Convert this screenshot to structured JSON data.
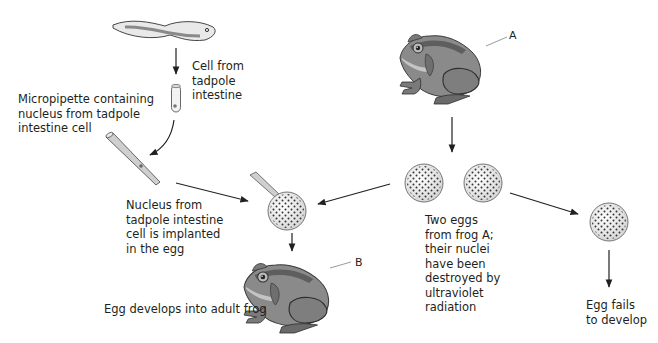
{
  "diagram": {
    "type": "process-flow",
    "topic": "Nuclear transplantation in frogs",
    "labels": {
      "cell_from_tadpole": "Cell from\ntadpole\nintestine",
      "micropipette": "Micropipette containing\nnucleus from tadpole\nintestine cell",
      "nucleus_implanted": "Nucleus from\ntadpole intestine\ncell is implanted\nin the egg",
      "egg_develops": "Egg develops into adult frog",
      "two_eggs": "Two eggs\nfrom frog A;\ntheir nuclei\nhave been\ndestroyed by\nultraviolet\nradiation",
      "egg_fails": "Egg fails\nto develop",
      "frog_a": "A",
      "frog_b": "B"
    },
    "nodes": [
      {
        "id": "tadpole",
        "name": "Tadpole"
      },
      {
        "id": "intestine-cell",
        "name": "Cell from tadpole intestine"
      },
      {
        "id": "micropipette",
        "name": "Micropipette with nucleus"
      },
      {
        "id": "frog-a",
        "name": "Frog A"
      },
      {
        "id": "egg-1",
        "name": "Enucleated egg 1"
      },
      {
        "id": "egg-2",
        "name": "Enucleated egg 2"
      },
      {
        "id": "implanted-egg",
        "name": "Egg with implanted nucleus"
      },
      {
        "id": "frog-b",
        "name": "Frog B (adult)"
      },
      {
        "id": "failed-egg",
        "name": "Egg fails to develop"
      }
    ],
    "edges": [
      {
        "from": "tadpole",
        "to": "intestine-cell"
      },
      {
        "from": "intestine-cell",
        "to": "micropipette"
      },
      {
        "from": "micropipette",
        "to": "implanted-egg"
      },
      {
        "from": "frog-a",
        "to": "egg-1"
      },
      {
        "from": "egg-1",
        "to": "implanted-egg"
      },
      {
        "from": "egg-2",
        "to": "failed-egg"
      },
      {
        "from": "implanted-egg",
        "to": "frog-b"
      }
    ],
    "colors": {
      "frog_body": "#8a8a8a",
      "frog_dark": "#5e5e5e",
      "frog_light": "#c4c4c4",
      "ink": "#231f20",
      "egg_fill": "#f4f4f4"
    }
  }
}
